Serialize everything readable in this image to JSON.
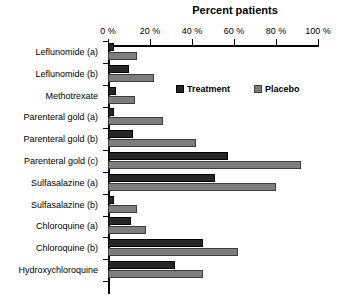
{
  "chart_data": {
    "type": "bar",
    "orientation": "horizontal",
    "title": "Percent patients",
    "xlabel": "Percent patients",
    "ylabel": "",
    "xlim": [
      0,
      100
    ],
    "grid": false,
    "legend_position": "inside-upper-right",
    "xticks": [
      0,
      20,
      40,
      60,
      80,
      100
    ],
    "xtick_labels": [
      "0 %",
      "20 %",
      "40 %",
      "60 %",
      "80 %",
      "100 %"
    ],
    "categories": [
      "Leflunomide (a)",
      "Leflunomide (b)",
      "Methotrexate",
      "Parenteral gold (a)",
      "Parenteral gold (b)",
      "Parenteral gold (c)",
      "Sulfasalazine (a)",
      "Sulfasalazine (b)",
      "Chloroquine (a)",
      "Chloroquine (b)",
      "Hydroxychloroquine"
    ],
    "series": [
      {
        "name": "Treatment",
        "color": "#262626",
        "values": [
          3,
          10,
          4,
          3,
          12,
          57,
          51,
          3,
          11,
          45,
          32
        ]
      },
      {
        "name": "Placebo",
        "color": "#7d7d7d",
        "values": [
          14,
          22,
          13,
          26,
          42,
          92,
          80,
          14,
          18,
          62,
          45
        ]
      }
    ]
  },
  "legend": {
    "items": [
      {
        "label": "Treatment",
        "swatch": "treatment"
      },
      {
        "label": "Placebo",
        "swatch": "placebo"
      }
    ]
  }
}
